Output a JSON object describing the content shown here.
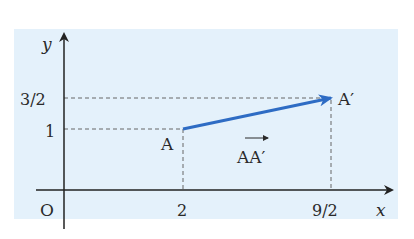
{
  "figure": {
    "background_color": "#e4f1fb",
    "axis_color": "#222222",
    "vector_color": "#2e6cc4",
    "guide_color": "#555555",
    "axes": {
      "x_label": "x",
      "y_label": "y",
      "origin_label": "O"
    },
    "ticks": {
      "x": [
        {
          "label": "2",
          "value": 2
        },
        {
          "label": "9/2",
          "value": 4.5
        }
      ],
      "y": [
        {
          "label": "1",
          "value": 1
        },
        {
          "label": "3/2",
          "value": 1.5
        }
      ]
    },
    "points": [
      {
        "name": "A",
        "x": 2,
        "y": 1
      },
      {
        "name": "A′",
        "x": 4.5,
        "y": 1.5
      }
    ],
    "vector": {
      "from": "A",
      "to": "A′",
      "label": "AA′"
    }
  }
}
